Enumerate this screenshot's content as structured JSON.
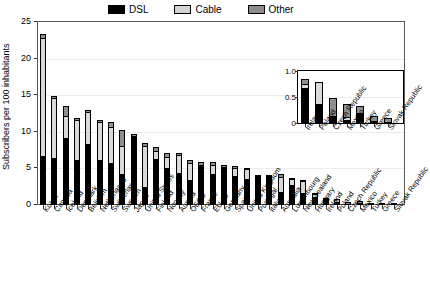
{
  "legend": {
    "position": "top-center",
    "items": [
      {
        "label": "DSL",
        "color": "#000000",
        "name": "dsl"
      },
      {
        "label": "Cable",
        "color": "#d9d9d9",
        "name": "cable"
      },
      {
        "label": "Other",
        "color": "#8f8f8f",
        "name": "other"
      }
    ]
  },
  "chart_data": {
    "type": "bar",
    "title": "",
    "xlabel": "",
    "ylabel": "Subscribers per 100 inhabitants",
    "ylim": [
      0,
      25
    ],
    "yticks": [
      0,
      5,
      10,
      15,
      20,
      25
    ],
    "ytick_labels": [
      "0",
      "5",
      "10",
      "15",
      "20",
      "25"
    ],
    "grid": true,
    "stacked": true,
    "legend_position": "top-center",
    "categories": [
      "Korea",
      "Canada",
      "Iceland",
      "Denmark",
      "Belgium",
      "Netherlands",
      "Switzerland",
      "Sweden",
      "Japan",
      "United States",
      "Finland",
      "Norway",
      "Austria",
      "OECD",
      "France",
      "EU 15",
      "Germany",
      "Spain",
      "United Kingdom",
      "Portugal",
      "Italy",
      "Australia",
      "Luxembourg",
      "New Zealand",
      "Hungary",
      "Ireland",
      "Poland",
      "Czech Republic",
      "Mexico",
      "Turkey",
      "Greece",
      "Slovak Republic"
    ],
    "series": [
      {
        "name": "DSL",
        "color": "#000000",
        "values": [
          6.7,
          6.4,
          9.1,
          6.2,
          8.4,
          6.1,
          5.7,
          4.2,
          9.4,
          2.5,
          6.3,
          5.1,
          4.4,
          3.4,
          5.3,
          4.3,
          5.1,
          4.0,
          3.5,
          3.9,
          3.9,
          1.8,
          2.7,
          1.6,
          1.1,
          0.67,
          0.37,
          0.14,
          0.05,
          0.2,
          0.03,
          0.02
        ]
      },
      {
        "name": "Cable",
        "color": "#d9d9d9",
        "values": [
          16.1,
          8.2,
          3.1,
          5.4,
          4.3,
          5.3,
          5.0,
          3.9,
          0.0,
          5.6,
          1.1,
          1.5,
          2.5,
          2.4,
          0.2,
          1.2,
          0.1,
          1.0,
          1.4,
          0.0,
          0.0,
          2.0,
          0.8,
          1.7,
          0.4,
          0.08,
          0.41,
          0.0,
          0.06,
          0.0,
          0.0,
          0.0
        ]
      },
      {
        "name": "Other",
        "color": "#8f8f8f",
        "values": [
          0.5,
          0.3,
          1.3,
          0.3,
          0.3,
          0.2,
          0.7,
          2.2,
          0.3,
          0.4,
          0.5,
          0.5,
          0.2,
          0.4,
          0.4,
          0.4,
          0.2,
          0.3,
          0.2,
          0.2,
          0.1,
          0.4,
          0.2,
          0.1,
          0.1,
          0.1,
          0.0,
          0.34,
          0.25,
          0.12,
          0.11,
          0.08
        ]
      }
    ],
    "totals": [
      23.3,
      14.9,
      13.5,
      11.9,
      13.0,
      11.6,
      11.4,
      10.3,
      9.7,
      8.5,
      7.9,
      7.1,
      7.1,
      6.2,
      5.9,
      5.9,
      5.4,
      5.3,
      5.1,
      4.1,
      4.0,
      4.2,
      3.7,
      3.4,
      1.6,
      0.85,
      0.78,
      0.48,
      0.36,
      0.32,
      0.14,
      0.1
    ],
    "inset": {
      "type": "bar",
      "stacked": true,
      "ylim": [
        0,
        1.0
      ],
      "yticks": [
        0,
        0.5,
        1.0
      ],
      "ytick_labels": [
        "0",
        "0.5",
        "1.0"
      ],
      "categories": [
        "Ireland",
        "Poland",
        "Czech Republic",
        "Mexico",
        "Turkey",
        "Greece",
        "Slovak Republic"
      ],
      "series": [
        {
          "name": "DSL",
          "color": "#000000",
          "values": [
            0.67,
            0.37,
            0.14,
            0.05,
            0.2,
            0.03,
            0.02
          ]
        },
        {
          "name": "Cable",
          "color": "#d9d9d9",
          "values": [
            0.08,
            0.41,
            0.0,
            0.06,
            0.0,
            0.0,
            0.0
          ]
        },
        {
          "name": "Other",
          "color": "#8f8f8f",
          "values": [
            0.1,
            0.0,
            0.34,
            0.25,
            0.12,
            0.11,
            0.08
          ]
        }
      ],
      "totals": [
        0.85,
        0.78,
        0.48,
        0.36,
        0.32,
        0.14,
        0.1
      ]
    }
  }
}
